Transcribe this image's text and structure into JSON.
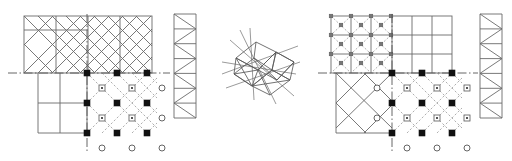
{
  "figure": {
    "clipped_header_text": "",
    "background_color": "#ffffff",
    "ink_color": "#5a5a5a",
    "dark_ink_color": "#333333",
    "marker_fill_color": "#111111",
    "panel_count": 5
  },
  "panels": [
    {
      "id": "panel-left-cell",
      "name": "left-unit-cell",
      "label": "",
      "quadrants": [
        {
          "position": "upper-left",
          "pattern": "solid-diagonal-X-lattice",
          "line_style": "solid"
        },
        {
          "position": "upper-right",
          "pattern": "solid-diagonal-X-lattice",
          "line_style": "solid"
        },
        {
          "position": "lower-left",
          "pattern": "solid-square-grid",
          "line_style": "solid"
        },
        {
          "position": "lower-right",
          "pattern": "dashed-diagonal-lattice",
          "line_style": "dashed"
        }
      ],
      "axes": {
        "horizontal": "dash-dot",
        "vertical": "dash-dot"
      },
      "markers": [
        {
          "kind": "filled-square",
          "count": 9
        },
        {
          "kind": "open-square",
          "count": 6
        },
        {
          "kind": "open-circle",
          "count": 9
        }
      ]
    },
    {
      "id": "panel-left-strip",
      "name": "left-triangulated-strip",
      "label": "",
      "pattern": "zigzag-truss",
      "bays": 7,
      "line_style": "solid"
    },
    {
      "id": "panel-center-cluster",
      "name": "center-polyhedral-cluster",
      "label": "",
      "pattern": "tilted-quadrilateral-cluster-with-radiating-axes",
      "line_style": "solid"
    },
    {
      "id": "panel-right-cell",
      "name": "right-unit-cell",
      "label": "",
      "quadrants": [
        {
          "position": "upper-left",
          "pattern": "grid-with-dashed-X-crosses",
          "line_style": "mixed"
        },
        {
          "position": "upper-right",
          "pattern": "solid-square-grid",
          "line_style": "solid"
        },
        {
          "position": "lower-left",
          "pattern": "solid-diagonal-lattice",
          "line_style": "solid"
        },
        {
          "position": "lower-right",
          "pattern": "dashed-diagonal-lattice",
          "line_style": "dashed"
        }
      ],
      "axes": {
        "horizontal": "dash-dot",
        "vertical": "dash-dot"
      },
      "markers": [
        {
          "kind": "filled-square",
          "count": 11
        },
        {
          "kind": "open-square",
          "count": 8
        },
        {
          "kind": "open-circle",
          "count": 10
        }
      ]
    },
    {
      "id": "panel-right-strip",
      "name": "right-triangulated-strip",
      "label": "",
      "pattern": "zigzag-truss",
      "bays": 7,
      "line_style": "solid"
    }
  ]
}
